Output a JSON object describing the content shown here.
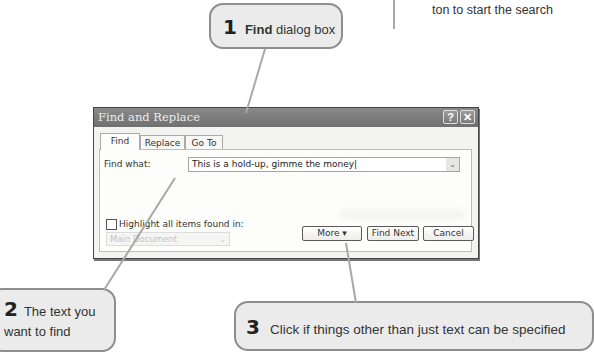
{
  "previous_caption": {
    "text": "ton to start the search"
  },
  "callouts": [
    {
      "number": "1",
      "bold": "Find",
      "text": "dialog box"
    },
    {
      "number": "2",
      "text": "The text you want to find"
    },
    {
      "number": "3",
      "text": "Click if things other than just text can be specified"
    }
  ],
  "dialog": {
    "title": "Find and Replace",
    "help_button": "?",
    "close_button": "✕",
    "tabs": [
      {
        "label": "Find",
        "active": true
      },
      {
        "label": "Replace",
        "active": false
      },
      {
        "label": "Go To",
        "active": false
      }
    ],
    "find_what_label": "Find what:",
    "find_what_value": "This is a hold-up, gimme the money",
    "highlight_label": "Highlight all items found in:",
    "highlight_checked": false,
    "scope_value": "Main Document",
    "buttons": {
      "more": "More",
      "more_arrow": "▾",
      "find_next": "Find Next",
      "cancel": "Cancel"
    }
  }
}
